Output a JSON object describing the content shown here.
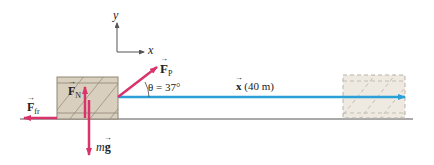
{
  "axes": {
    "x_label": "x",
    "y_label": "y"
  },
  "forces": {
    "pull": {
      "symbol": "F",
      "subscript": "P"
    },
    "normal": {
      "symbol": "F",
      "subscript": "N"
    },
    "friction": {
      "symbol": "F",
      "subscript": "fr"
    },
    "gravity": {
      "prefix": "m",
      "symbol": "g"
    }
  },
  "angle": {
    "label": "θ = 37°",
    "value_deg": 37
  },
  "displacement": {
    "symbol": "x",
    "label": "(40 m)",
    "value_m": 40
  },
  "colors": {
    "force_arrow": "#d8336b",
    "displacement_arrow": "#2a9fd8",
    "box_fill": "#d9cfbf",
    "ground": "#555555"
  }
}
